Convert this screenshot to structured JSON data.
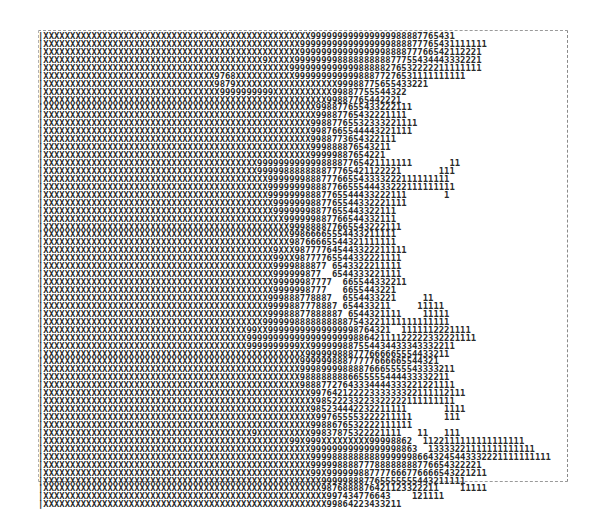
{
  "plot": {
    "border_top": "------------------------------------------------------------------------------------------------",
    "rows": [
      "|XXXXXXXXXXXXXXXXXXXXXXXXXXXXXXXXXXXXXXXXXXXXXXXXXX999999999999999988887765431",
      "|XXXXXXXXXXXXXXXXXXXXXXXXXXXXXXXXXXXXXXXXXXXXXXXX99999999999999999888877765431111111",
      "|XXXXXXXXXXXXXXXXXXXXXXXXXXXXXXXXXXXXXXXXXXXXXXXX9999999999999999888877766542112221",
      "|XXXXXXXXXXXXXXXXXXXXXXXXXXXXXXXXXXXXXXXXX9XXXXX99999999888888888877755434443332221",
      "|XXXXXXXXXXXXXXXXXXXXXXXXXXXXXXXXXXXXXXXXXXXXXX999999999999988888276532222211111111",
      "|XXXXXXXXXXXXXXXXXXXXXXXXXXXXXXXX9768XXXXXXXXXXX99999999999988877276531111111111",
      "|XXXXXXXXXXXXXXXXXXXXXXXXXXXXXXXX9879XXXXXXXXXXXXXXXXXXX99988775655433221",
      "|XXXXXXXXXXXXXXXXXXXXXXXXXXXXXXXXX9999999999XXXXXXXXXXX99887755544322",
      "|XXXXXXXXXXXXXXXXXXXXXXXXXXXXXXXXXXXXXXXXXXXXXXXXXXXXX99887765442221",
      "|XXXXXXXXXXXXXXXXXXXXXXXXXXXXXXXXXXXXXXXXXXXXXXXXXXX998877655433222111",
      "|XXXXXXXXXXXXXXXXXXXXXXXXXXXXXXXXXXXXXXXXXXXXXXXXXXX99887765432221111",
      "|XXXXXXXXXXXXXXXXXXXXXXXXXXXXXXXXXXXXXXXXXXXXXXXXXX99887765532333221111",
      "|XXXXXXXXXXXXXXXXXXXXXXXXXXXXXXXXXXXXXXXXXXXXXXXXXX9987665544443221111",
      "|XXXXXXXXXXXXXXXXXXXXXXXXXXXXXXXXXXXXXXXXXXXXXXXXXX9988773654322111",
      "|XXXXXXXXXXXXXXXXXXXXXXXXXXXXXXXXXXXXXXXXXXXXXXXXXX999888876543211",
      "|XXXXXXXXXXXXXXXXXXXXXXXXXXXXXXXXXXXXXXXXXXXXXXXXXX99999887654221",
      "|XXXXXXXXXXXXXXXXXXXXXXXXXXXXXXXXXXXXXXXX99999999999988887765421111111       11",
      "|XXXXXXXXXXXXXXXXXXXXXXXXXXXXXXXXXXXXXXXX999998888888877765421122221       111",
      "|XXXXXXXXXXXXXXXXXXXXXXXXXXXXXXXXXXXXXXXXXX9999999888777665543333222111111111",
      "|XXXXXXXXXXXXXXXXXXXXXXXXXXXXXXXXXXXXXXXXXX99999999888776655544433222111111111",
      "|XXXXXXXXXXXXXXXXXXXXXXXXXXXXXXXXXXXXXXXXXX99999998887765544433222111       1",
      "|XXXXXXXXXXXXXXXXXXXXXXXXXXXXXXXXXXXXXXXXXXX9999999887765544332221111",
      "|XXXXXXXXXXXXXXXXXXXXXXXXXXXXXXXXXXXXXXXXXXX99999998877655443322111",
      "|XXXXXXXXXXXXXXXXXXXXXXXXXXXXXXXXXXXXXXXXXXXXX999999887766544332111",
      "|XXXXXXXXXXXXXXXXXXXXXXXXXXXXXXXXXXXXXXXXXXXXXX999888877665543222111",
      "|XXXXXXXXXXXXXXXXXXXXXXXXXXXXXXXXXXXXXXXXXXXXXX99866665554433211111",
      "|XXXXXXXXXXXXXXXXXXXXXXXXXXXXXXXXXXXXXXXXXXXXXX98766665544321111111",
      "|XXXXXXXXXXXXXXXXXXXXXXXXXXXXXXXXXXXXXXXXXXX9XXX987777645443322211111",
      "|XXXXXXXXXXXXXXXXXXXXXXXXXXXXXXXXXXXXXXXXXXX99XX98777765544332221111",
      "|XXXXXXXXXXXXXXXXXXXXXXXXXXXXXXXXXXXXXXXXXXX9999888877 6543322211111",
      "|XXXXXXXXXXXXXXXXXXXXXXXXXXXXXXXXXXXXXXXXXXX999999877  6544333221111",
      "|XXXXXXXXXXXXXXXXXXXXXXXXXXXXXXXXXXXXXXXXXXX99999987777  665544332211",
      "|XXXXXXXXXXXXXXXXXXXXXXXXXXXXXXXXXXXXXXXXXXX9999998777   6655443221",
      "|XXXXXXXXXXXXXXXXXXXXXXXXXXXXXXXXXXXXXXXXXX999888778887  6554433221     11",
      "|XXXXXXXXXXXXXXXXXXXXXXXXXXXXXXXXXXXXXXXXXX9999887778887 654433211     11111",
      "|XXXXXXXXXXXXXXXXXXXXXXXXXXXXXXXXXXXXXXXXXX99988877888887 6544321111    11111",
      "|XXXXXXXXXXXXXXXXXXXXXXXXXXXXXXXXXXXXXXXXX99999988888888887543221111111111111",
      "|XXXXXXXXXXXXXXXXXXXXXXXXXXXXXXXXXXXXXX99XX99999999999999998764321  1111112221111",
      "|XXXXXXXXXXXXXXXXXXXXXXXXXXXXXXXXXXXXXX9999999999999999999988642111122222332221111",
      "|XXXXXXXXXXXXXXXXXXXXXXXXXXXXXXXXXXXXXX9999999999XX999999887554434433343332211",
      "|XXXXXXXXXXXXXXXXXXXXXXXXXXXXXXXXXXXXXXXXXXXXXXXXX999999888777666665554433211",
      "|XXXXXXXXXXXXXXXXXXXXXXXXXXXXXXXXXXXXXXXXXXXXXXXX99999988877777666665544321",
      "|XXXXXXXXXXXXXXXXXXXXXXXXXXXXXXXXXXXXXXXXXXXXXXXX99989999888876665555543333211",
      "|XXXXXXXXXXXXXXXXXXXXXXXXXXXXXXXXXXXXXXXXXXXXXXXX9888888886655555444433332211",
      "|XXXXXXXXXXXXXXXXXXXXXXXXXXXXXXXXXXXXXXXXXXXXXXXX98887727643334444333221221111",
      "|XXXXXXXXXXXXXXXXXXXXXXXXXXXXXXXXXXXXXXXXXXXXXXXXXX99764212222333333322111112111",
      "|XXXXXXXXXXXXXXXXXXXXXXXXXXXXXXXXXXXXXXXXXXXXXXXXXXX98522233223322222111111111",
      "|XXXXXXXXXXXXXXXXXXXXXXXXXXXXXXXXXXXXXXXXXXXXXXXXXX985234442232211111       1111",
      "|XXXXXXXXXXXXXXXXXXXXXXXXXXXXXXXXXXXXXXXXXXXXXXXXXXX997655553222211111      111",
      "|XXXXXXXXXXXXXXXXXXXXXXXXXXXXXXXXXXXXXXXXXXXXXXXXXX9988676532222111111",
      "|XXXXXXXXXXXXXXXXXXXXXXXXXXXXXXXXXXXXXXX9XXXXXXXXXX99837875322221111   11   111",
      "|XXXXXXXXXXXXXXXXXXXXXXXXXXXXXXXXXXXXXXXXXXXXXX99X999XXXXXXXXX99998862  1122111111111111111",
      "|XXXXXXXXXXXXXXXXXXXXXXXXXXXXXXXXXXXXXXXXXXXXXXXXXX99999999999999998863  13333221111111111111",
      "|XXXXXXXXXXXXXXXXXXXXXXXXXXXXXXXXXXXXXXXXXXXXXXXXXX999988888888899999986643245443332221111111111",
      "|XXXXXXXXXXXXXXXXXXXXXXXXXXXXXXXXXXXXXXXXXXXXXXXXXX99999888877788888888776654322221",
      "|XXXXXXXXXXXXXXXXXXXXXXXXXXXXXXXXXXXXXXXXXXXXXXXXXX99X999999887777666776666543221211",
      "|XXXXXXXXXXXXXXXXXXXXXXXXXXXXXXXXXXXXXXXXXXXXXXXXXXXX999998887765555555443211111",
      "|XXXXXXXXXXXXXXXXXXXXXXXXXXXXXXXXXXXXXXXXXXXXXXXXXXXX9876888876421123322211    11111",
      "|XXXXXXXXXXXXXXXXXXXXXXXXXXXXXXXXXXXXXXXXXXXXXXXXXXXXX997434776643    121111",
      "|XXXXXXXXXXXXXXXXXXXXXXXXXXXXXXXXXXXXXXXXXXXXXXXXXXXXX99864223433211"
    ],
    "border_bottom": "------------------------------------------------------------------------------------------------"
  }
}
